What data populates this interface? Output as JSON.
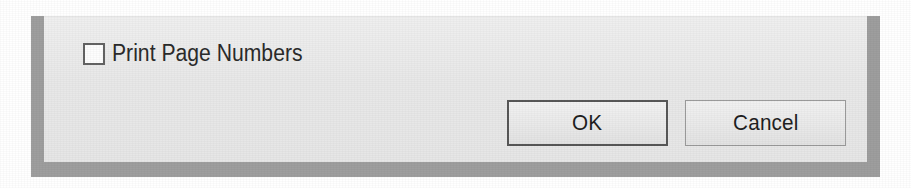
{
  "dialog": {
    "options": [
      {
        "id": "print-page-numbers",
        "label": "Print Page Numbers",
        "checked": false,
        "control": "checkbox"
      }
    ],
    "buttons": [
      {
        "id": "ok",
        "label": "OK",
        "default": true
      },
      {
        "id": "cancel",
        "label": "Cancel",
        "default": false
      }
    ]
  },
  "colors": {
    "panel_background": "#e9e9e9",
    "frame_border": "#9e9e9e",
    "page_background": "#ffffff",
    "text": "#2b2b2b",
    "checkbox_border": "#636363",
    "ok_button_border": "#575757",
    "cancel_button_border": "#9a9a9a"
  }
}
